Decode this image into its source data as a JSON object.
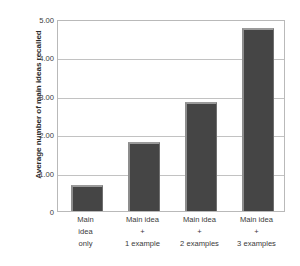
{
  "chart_data": {
    "type": "bar",
    "title": "",
    "subtitle": "",
    "xlabel": "",
    "ylabel": "Average number of main ideas recalled",
    "categories": [
      "Main idea only",
      "Main idea + 1 example",
      "Main idea + 2 examples",
      "Main idea + 3 examples"
    ],
    "category_lines": [
      [
        "Main",
        "idea",
        "only"
      ],
      [
        "Main idea",
        "+",
        "1 example"
      ],
      [
        "Main idea",
        "+",
        "2 examples"
      ],
      [
        "Main idea",
        "+",
        "3 examples"
      ]
    ],
    "values": [
      0.68,
      1.8,
      2.84,
      4.77
    ],
    "ylim": [
      0,
      5
    ],
    "ytick_values": [
      0,
      1,
      2,
      3,
      4,
      5
    ],
    "ytick_labels": [
      "0",
      "1.00",
      "2.00",
      "3.00",
      "4.00",
      "5.00"
    ],
    "grid": true,
    "legend": false,
    "legend_position": "none",
    "bar_color": "#454545",
    "bar_edge_light": "#9a9a9a",
    "gridline_color": "#c2c2c2",
    "axis_border_color": "#b9b9b9",
    "background_color": "#ffffff",
    "text_color": "#3a3a3a"
  }
}
